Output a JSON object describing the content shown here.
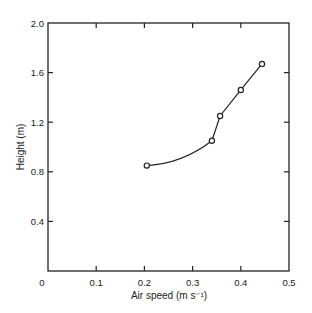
{
  "chart_data": {
    "type": "line",
    "title": "",
    "xlabel": "Air speed (m s⁻¹)",
    "ylabel": "Height (m)",
    "xlim": [
      0,
      0.5
    ],
    "ylim": [
      0,
      2.0
    ],
    "xticks": [
      "0",
      "0.1",
      "0.2",
      "0.3",
      "0.4",
      "0.5"
    ],
    "yticks": [
      "0.4",
      "0.8",
      "1.2",
      "1.6",
      "2.0"
    ],
    "grid": false,
    "legend": null,
    "series": [
      {
        "name": "profile",
        "marker": "open-circle",
        "x": [
          0.205,
          0.34,
          0.357,
          0.4,
          0.444
        ],
        "y": [
          0.85,
          1.05,
          1.25,
          1.46,
          1.67
        ]
      }
    ]
  }
}
